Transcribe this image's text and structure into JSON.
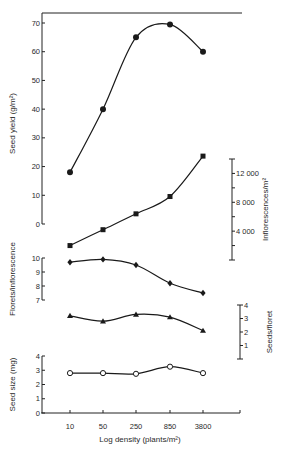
{
  "chart_data": {
    "type": "line",
    "title": "",
    "xlabel": "Log density (plants/m²)",
    "categories": [
      "10",
      "50",
      "250",
      "850",
      "3800"
    ],
    "x_scale": "log",
    "x_positions_px": [
      70,
      103,
      136,
      170,
      203
    ],
    "panels": [
      {
        "id": "seed-yield",
        "ylabel": "Seed yield (g/m²)",
        "axis_side": "left",
        "ylim": [
          0,
          70
        ],
        "ticks": [
          0,
          10,
          20,
          30,
          40,
          50,
          60,
          70
        ],
        "tick_labels": [
          "0",
          "10",
          "20",
          "30",
          "40",
          "50",
          "60",
          "70"
        ],
        "marker": "filled-circle",
        "series": [
          {
            "name": "Seed yield",
            "values": [
              18,
              40,
              65,
              69.5,
              60
            ]
          }
        ]
      },
      {
        "id": "inflorescences",
        "ylabel": "Inflorescences/m²",
        "axis_side": "right",
        "ylim": [
          0,
          14000
        ],
        "ticks": [
          0,
          2000,
          4000,
          6000,
          8000,
          10000,
          12000,
          14000
        ],
        "tick_labels": [
          "",
          "",
          "4 000",
          "",
          "8 000",
          "",
          "12 000",
          ""
        ],
        "marker": "filled-square",
        "series": [
          {
            "name": "Inflorescences",
            "values": [
              2000,
              4200,
              6400,
              8800,
              14400
            ]
          }
        ]
      },
      {
        "id": "florets",
        "ylabel": "Florets/inflorescence",
        "axis_side": "left",
        "ylim": [
          7,
          10
        ],
        "ticks": [
          7,
          8,
          9,
          10
        ],
        "tick_labels": [
          "7",
          "8",
          "9",
          "10"
        ],
        "marker": "filled-diamond",
        "series": [
          {
            "name": "Florets/inflorescence",
            "values": [
              9.7,
              9.9,
              9.5,
              8.2,
              7.5
            ]
          }
        ]
      },
      {
        "id": "seeds-per-floret",
        "ylabel": "Seeds/floret",
        "axis_side": "right",
        "ylim": [
          0,
          4
        ],
        "ticks": [
          0,
          1,
          2,
          3,
          4
        ],
        "tick_labels": [
          "",
          "1",
          "2",
          "3",
          "4"
        ],
        "marker": "filled-triangle",
        "series": [
          {
            "name": "Seeds/floret",
            "values": [
              3.2,
              2.8,
              3.3,
              3.1,
              2.1
            ]
          }
        ]
      },
      {
        "id": "seed-size",
        "ylabel": "Seed size (mg)",
        "axis_side": "left",
        "ylim": [
          0,
          4
        ],
        "ticks": [
          0,
          1,
          2,
          3,
          4
        ],
        "tick_labels": [
          "0",
          "1",
          "2",
          "3",
          "4"
        ],
        "marker": "open-circle",
        "series": [
          {
            "name": "Seed size",
            "values": [
              2.8,
              2.8,
              2.75,
              3.25,
              2.8
            ]
          }
        ]
      }
    ],
    "grid": false,
    "legend": "none"
  },
  "layout": {
    "seed-yield": {
      "axis_x": 42,
      "y_top": 23,
      "y_bottom": 224,
      "axis_top": 13,
      "label_x": 15
    },
    "inflorescences": {
      "axis_x": 232,
      "y_top": 159,
      "y_bottom": 260,
      "axis_top": 159,
      "label_x": 268
    },
    "florets": {
      "axis_x": 42,
      "y_top": 258,
      "y_bottom": 300,
      "axis_top": 258,
      "label_x": 15
    },
    "seeds-per-floret": {
      "axis_x": 240,
      "y_top": 305,
      "y_bottom": 359,
      "axis_top": 305,
      "label_x": 272
    },
    "seed-size": {
      "axis_x": 42,
      "y_top": 356,
      "y_bottom": 413,
      "axis_top": 356,
      "label_x": 15
    },
    "x_axis": {
      "x_start": 41,
      "x_end": 240,
      "y": 413,
      "label_y": 429,
      "title_y": 442,
      "title_x": 140
    },
    "top_line": {
      "x1": 42,
      "x2": 242,
      "y": 13
    }
  },
  "colors": {
    "ink": "#1a1a1a",
    "background": "#ffffff"
  }
}
